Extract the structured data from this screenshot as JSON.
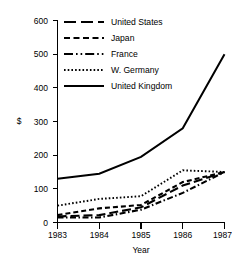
{
  "chart_data": {
    "type": "line",
    "title": "",
    "xlabel": "Year",
    "ylabel": "$",
    "categories": [
      "1983",
      "1984",
      "1985",
      "1986",
      "1987"
    ],
    "x": [
      1983,
      1984,
      1985,
      1986,
      1987
    ],
    "xlim": [
      1983,
      1987
    ],
    "ylim": [
      0,
      600
    ],
    "yticks": [
      0,
      100,
      200,
      300,
      400,
      500,
      600
    ],
    "ytick_labels": [
      "0",
      "100",
      "200",
      "300",
      "400",
      "500",
      "600"
    ],
    "grid": false,
    "legend_position": "top-right",
    "series": [
      {
        "name": "United States",
        "line_style": "long-dash",
        "color": "#000000",
        "values": [
          18,
          22,
          45,
          110,
          150
        ]
      },
      {
        "name": "Japan",
        "line_style": "dash",
        "color": "#000000",
        "values": [
          22,
          42,
          52,
          120,
          150
        ]
      },
      {
        "name": "France",
        "line_style": "dash-dot",
        "color": "#000000",
        "values": [
          15,
          15,
          38,
          88,
          150
        ]
      },
      {
        "name": "W. Germany",
        "line_style": "dotted",
        "color": "#000000",
        "values": [
          50,
          70,
          78,
          155,
          150
        ]
      },
      {
        "name": "United Kingdom",
        "line_style": "solid",
        "color": "#000000",
        "values": [
          130,
          145,
          195,
          280,
          500
        ]
      }
    ]
  },
  "axis": {
    "y_label": "$",
    "x_label": "Year",
    "y_tick_0": "0",
    "y_tick_100": "100",
    "y_tick_200": "200",
    "y_tick_300": "300",
    "y_tick_400": "400",
    "y_tick_500": "500",
    "y_tick_600": "600",
    "x_tick_1983": "1983",
    "x_tick_1984": "1984",
    "x_tick_1985": "1985",
    "x_tick_1986": "1986",
    "x_tick_1987": "1987"
  },
  "legend": {
    "entries": [
      {
        "label": "United States"
      },
      {
        "label": "Japan"
      },
      {
        "label": "France"
      },
      {
        "label": "W. Germany"
      },
      {
        "label": "United Kingdom"
      }
    ]
  }
}
